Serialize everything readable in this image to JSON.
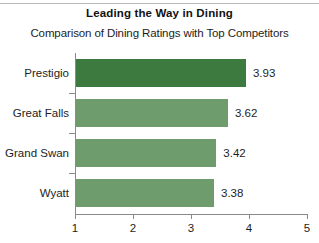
{
  "title": "Leading the Way in Dining",
  "subtitle": "Comparison of Dining Ratings with Top Competitors",
  "colors": {
    "bar_highlight": "#3d7a3f",
    "bar_default": "#6f9c6d",
    "axis": "#8a8a8a",
    "text": "#1d1d1d",
    "background": "#ffffff"
  },
  "axis": {
    "x_ticks": [
      "1",
      "2",
      "3",
      "4",
      "5"
    ],
    "x_min": 1,
    "x_max": 5
  },
  "rows": [
    {
      "label": "Prestigio",
      "value": 3.93,
      "value_label": "3.93",
      "highlight": true
    },
    {
      "label": "Great Falls",
      "value": 3.62,
      "value_label": "3.62",
      "highlight": false
    },
    {
      "label": "Grand Swan",
      "value": 3.42,
      "value_label": "3.42",
      "highlight": false
    },
    {
      "label": "Wyatt",
      "value": 3.38,
      "value_label": "3.38",
      "highlight": false
    }
  ],
  "chart_data": {
    "type": "bar",
    "orientation": "horizontal",
    "title": "Leading the Way in Dining",
    "subtitle": "Comparison of Dining Ratings with Top Competitors",
    "categories": [
      "Prestigio",
      "Great Falls",
      "Grand Swan",
      "Wyatt"
    ],
    "values": [
      3.93,
      3.62,
      3.42,
      3.38
    ],
    "data_labels": [
      "3.93",
      "3.62",
      "3.42",
      "3.38"
    ],
    "xlabel": "",
    "ylabel": "",
    "xlim": [
      1,
      5
    ],
    "xticks": [
      1,
      2,
      3,
      4,
      5
    ],
    "grid": false,
    "legend": false,
    "series_colors": [
      "#3d7a3f",
      "#6f9c6d",
      "#6f9c6d",
      "#6f9c6d"
    ]
  }
}
